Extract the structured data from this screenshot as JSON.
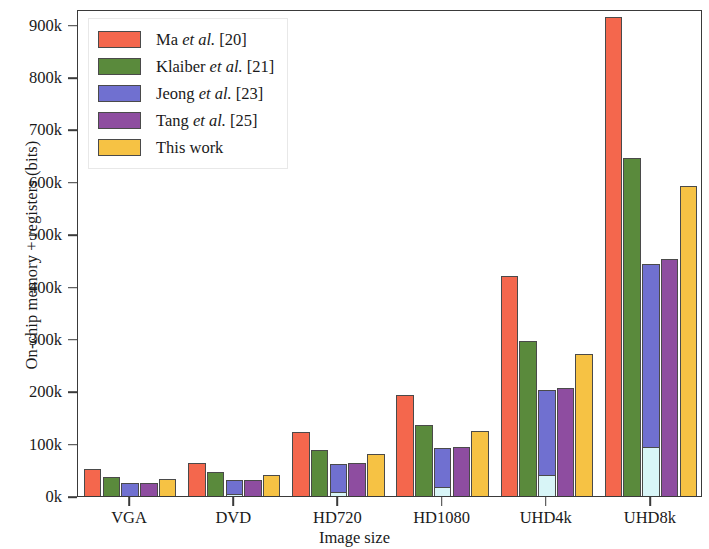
{
  "chart_data": {
    "type": "bar",
    "title": "",
    "xlabel": "Image size",
    "ylabel": "On-chip memory + registers (bits)",
    "categories": [
      "VGA",
      "DVD",
      "HD720",
      "HD1080",
      "UHD4k",
      "UHD8k"
    ],
    "ylim": [
      0,
      930000
    ],
    "yticks": [
      0,
      100000,
      200000,
      300000,
      400000,
      500000,
      600000,
      700000,
      800000,
      900000
    ],
    "ytick_labels": [
      "0k",
      "100k",
      "200k",
      "300k",
      "400k",
      "500k",
      "600k",
      "700k",
      "800k",
      "900k"
    ],
    "grid": false,
    "legend_position": "upper-left",
    "series": [
      {
        "name": "Ma et al. [20]",
        "name_pre": "Ma ",
        "name_em": "et al.",
        "name_post": " [20]",
        "color": "#F4674D",
        "values": [
          55000,
          66000,
          125000,
          195000,
          424000,
          917000
        ]
      },
      {
        "name": "Klaiber et al. [21]",
        "name_pre": "Klaiber ",
        "name_em": "et al.",
        "name_post": " [21]",
        "color": "#5A8A3C",
        "values": [
          40000,
          48000,
          90000,
          139000,
          300000,
          648000
        ]
      },
      {
        "name": "Jeong et al. [23]",
        "name_pre": "Jeong ",
        "name_em": "et al.",
        "name_post": " [23]",
        "color": "#7070D0",
        "sub_color": "#D8F5F7",
        "values": [
          28000,
          34000,
          64000,
          95000,
          206000,
          447000
        ],
        "sub_values": [
          4000,
          6000,
          11000,
          20000,
          44000,
          96000
        ]
      },
      {
        "name": "Tang et al. [25]",
        "name_pre": "Tang ",
        "name_em": "et al.",
        "name_post": " [25]",
        "color": "#8E4DA0",
        "values": [
          28000,
          34000,
          66000,
          97000,
          210000,
          455000
        ]
      },
      {
        "name": "This work",
        "name_pre": "This work",
        "name_em": "",
        "name_post": "",
        "color": "#F6C244",
        "values": [
          36000,
          43000,
          83000,
          127000,
          275000,
          595000
        ]
      }
    ]
  }
}
